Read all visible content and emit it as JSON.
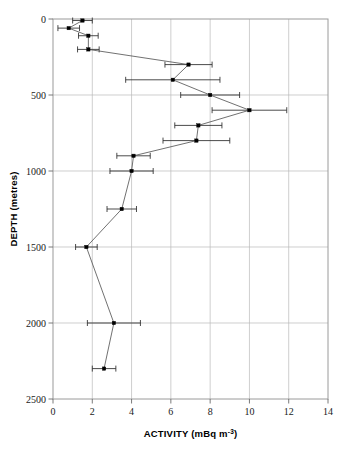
{
  "chart_data": {
    "type": "line",
    "title": "",
    "xlabel": "ACTIVITY (mBq m⁻³)",
    "xlabel_main": "ACTIVITY (mBq m",
    "xlabel_sup": "-3",
    "xlabel_tail": ")",
    "ylabel": "DEPTH (metres)",
    "xlim": [
      0,
      14
    ],
    "ylim": [
      0,
      2500
    ],
    "y_inverted": true,
    "grid": true,
    "xticks": [
      0,
      2,
      4,
      6,
      8,
      10,
      12,
      14
    ],
    "xtick_labels": [
      "0",
      "2",
      "4",
      "6",
      "8",
      "10",
      "12",
      "14"
    ],
    "yticks": [
      0,
      500,
      1000,
      1500,
      2000,
      2500
    ],
    "ytick_labels": [
      "0",
      "500",
      "1000",
      "1500",
      "2000",
      "2500"
    ],
    "series": [
      {
        "name": "activity profile",
        "marker": "square",
        "marker_color": "#000000",
        "line_color": "#4d4d4d",
        "errorbar_color": "#2b2b2b",
        "points": [
          {
            "depth": 10,
            "activity": 1.5,
            "error": 0.5
          },
          {
            "depth": 60,
            "activity": 0.8,
            "error": 0.55
          },
          {
            "depth": 110,
            "activity": 1.8,
            "error": 0.5
          },
          {
            "depth": 200,
            "activity": 1.8,
            "error": 0.55
          },
          {
            "depth": 300,
            "activity": 6.9,
            "error": 1.2
          },
          {
            "depth": 400,
            "activity": 6.1,
            "error": 2.4
          },
          {
            "depth": 500,
            "activity": 8.0,
            "error": 1.5
          },
          {
            "depth": 600,
            "activity": 10.0,
            "error": 1.9
          },
          {
            "depth": 700,
            "activity": 7.4,
            "error": 1.2
          },
          {
            "depth": 800,
            "activity": 7.3,
            "error": 1.7
          },
          {
            "depth": 900,
            "activity": 4.1,
            "error": 0.85
          },
          {
            "depth": 1000,
            "activity": 4.0,
            "error": 1.1
          },
          {
            "depth": 1250,
            "activity": 3.5,
            "error": 0.75
          },
          {
            "depth": 1500,
            "activity": 1.7,
            "error": 0.55
          },
          {
            "depth": 2000,
            "activity": 3.1,
            "error": 1.35
          },
          {
            "depth": 2300,
            "activity": 2.6,
            "error": 0.6
          }
        ]
      }
    ],
    "colors": {
      "grid": "#b9b9b9",
      "frame": "#9a9a9a",
      "text": "#1a1a1a",
      "background": "#ffffff"
    }
  },
  "layout": {
    "plot_left": 53,
    "plot_right": 328,
    "plot_top": 19,
    "plot_bottom": 399
  }
}
